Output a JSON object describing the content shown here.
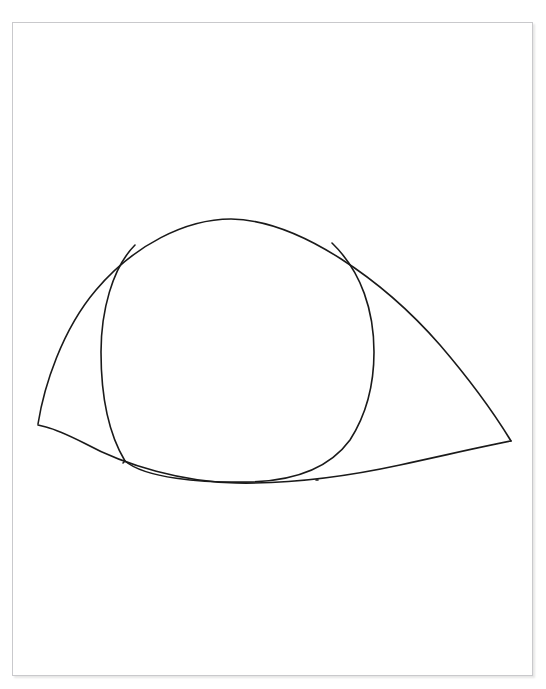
{
  "document": {
    "kind": "scanned-line-drawing",
    "background_color": "#ffffff",
    "ink_color": "#1a1a1a",
    "border_color": "#c9c9cc"
  },
  "header": {
    "clipped_text": "—  —— — —— ——— —— —— — ——",
    "note": "text row cut off by top edge of image"
  },
  "sheet": {
    "label": "drawing-sheet",
    "x": 12,
    "y": 22,
    "width": 521,
    "height": 654
  },
  "drawing": {
    "subject": "eye",
    "strokes": [
      {
        "name": "upper-eyelid",
        "d": "M 38 424 C 44 386 62 330 96 290 C 134 245 186 219 231 219 C 300 220 385 282 440 345 C 470 380 497 418 511 441"
      },
      {
        "name": "lower-eyelid",
        "d": "M 38 425 L 46 427 C 58 430 70 436 84 443 C 126 466 184 482 236 483 C 290 484 340 478 400 465 C 455 453 494 444 511 441"
      },
      {
        "name": "iris-outline",
        "d": "M 135 245 C 112 268 101 312 101 352 C 101 398 110 436 125 461 C 145 478 200 483 250 482 C 290 481 328 470 350 440 C 368 412 374 380 374 352 C 374 312 362 272 332 243"
      },
      {
        "name": "iris-lower-left-tail",
        "d": "M 125 461 C 124 462 124 462 123 463"
      },
      {
        "name": "iris-lower-right-tail",
        "d": "M 316 480 C 317 480 317 480 318 480"
      }
    ],
    "key_points": [
      {
        "name": "inner-canthus-left",
        "x": 38,
        "y": 424
      },
      {
        "name": "outer-canthus-right",
        "x": 511,
        "y": 441
      },
      {
        "name": "eyelid-apex-top",
        "x": 231,
        "y": 219
      },
      {
        "name": "eyelid-lowest",
        "x": 240,
        "y": 483
      },
      {
        "name": "iris-top-left-junction",
        "x": 135,
        "y": 245
      },
      {
        "name": "iris-top-right-junction",
        "x": 332,
        "y": 243
      },
      {
        "name": "iris-bottom-left-junction",
        "x": 125,
        "y": 462
      },
      {
        "name": "iris-bottom-right-junction",
        "x": 316,
        "y": 480
      },
      {
        "name": "iris-left-extreme",
        "x": 101,
        "y": 352
      },
      {
        "name": "iris-right-extreme",
        "x": 374,
        "y": 352
      }
    ]
  }
}
